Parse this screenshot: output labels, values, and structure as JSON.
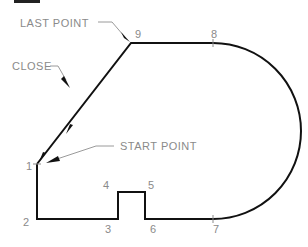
{
  "diagram": {
    "annotations": {
      "last_point": "LAST POINT",
      "close": "CLOSE",
      "start_point": "START POINT"
    },
    "points": [
      {
        "label": "1",
        "x": 37,
        "y": 164
      },
      {
        "label": "2",
        "x": 37,
        "y": 219
      },
      {
        "label": "3",
        "x": 118,
        "y": 219
      },
      {
        "label": "4",
        "x": 118,
        "y": 192
      },
      {
        "label": "5",
        "x": 145,
        "y": 192
      },
      {
        "label": "6",
        "x": 145,
        "y": 219
      },
      {
        "label": "7",
        "x": 213,
        "y": 219
      },
      {
        "label": "8",
        "x": 213,
        "y": 43
      },
      {
        "label": "9",
        "x": 131,
        "y": 43
      }
    ],
    "colors": {
      "outline": "#111111",
      "label_text": "#8a8a8a",
      "leader": "#9a9a9a"
    }
  }
}
